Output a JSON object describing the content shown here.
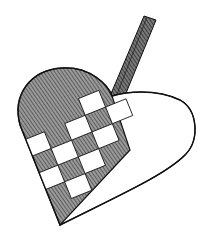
{
  "illustration": {
    "subject": "woven heart basket",
    "style": "black-and-white line engraving",
    "colors": {
      "background": "#ffffff",
      "ink": "#111111",
      "dark_strip": "#8a8a8a",
      "light_strip": "#ffffff"
    }
  }
}
